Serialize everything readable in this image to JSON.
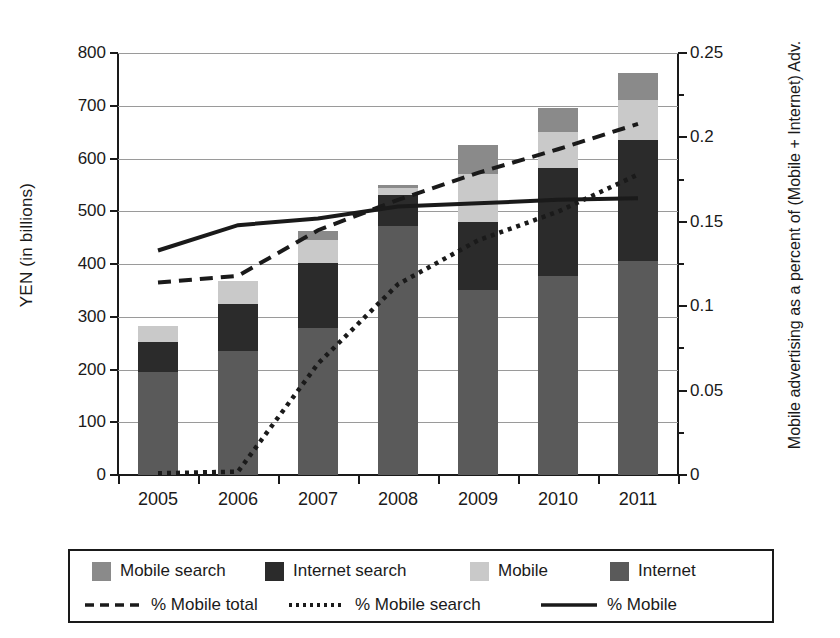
{
  "chart_data": {
    "type": "bar",
    "title": "",
    "xlabel": "",
    "ylabel": "YEN (in billions)",
    "ylabel_right": "Mobile advertising as a percent of (Mobile + Internet) Adv.",
    "categories": [
      "2005",
      "2006",
      "2007",
      "2008",
      "2009",
      "2010",
      "2011"
    ],
    "ylim": [
      0,
      800
    ],
    "yticks": [
      0,
      100,
      200,
      300,
      400,
      500,
      600,
      700,
      800
    ],
    "ytick_labels": [
      "0",
      "100",
      "200",
      "300",
      "400",
      "500",
      "600",
      "700",
      "800"
    ],
    "ylim_right": [
      0,
      0.25
    ],
    "yticks_right": [
      0,
      0.05,
      0.1,
      0.15,
      0.2,
      0.25
    ],
    "ytick_labels_right": [
      "0",
      "0.05",
      "0.1",
      "0.15",
      "0.2",
      "0.25"
    ],
    "yticks_right_minor": [
      0.025,
      0.075,
      0.125,
      0.175,
      0.225
    ],
    "grid": true,
    "legend_position": "below",
    "stacked": true,
    "series": [
      {
        "name": "Internet",
        "kind": "bar",
        "color": "#5a5a5a",
        "values": [
          195,
          235,
          278,
          472,
          350,
          378,
          405
        ]
      },
      {
        "name": "Internet search",
        "kind": "bar",
        "color": "#2b2b2b",
        "values": [
          57,
          90,
          124,
          58,
          130,
          204,
          230
        ]
      },
      {
        "name": "Mobile",
        "kind": "bar",
        "color": "#c9c9c9",
        "values": [
          31,
          43,
          43,
          15,
          90,
          68,
          75
        ]
      },
      {
        "name": "Mobile search",
        "kind": "bar",
        "color": "#8a8a8a",
        "values": [
          0,
          0,
          17,
          5,
          55,
          45,
          52
        ]
      },
      {
        "name": "% Mobile total",
        "kind": "line",
        "style": "dashed",
        "axis": "right",
        "color": "#1a1a1a",
        "values": [
          0.114,
          0.118,
          0.145,
          0.163,
          0.179,
          0.193,
          0.208
        ]
      },
      {
        "name": "% Mobile search",
        "kind": "line",
        "style": "dotted",
        "axis": "right",
        "color": "#1a1a1a",
        "values": [
          0.001,
          0.002,
          0.066,
          0.113,
          0.139,
          0.156,
          0.178
        ]
      },
      {
        "name": "% Mobile",
        "kind": "line",
        "style": "solid",
        "axis": "right",
        "color": "#1a1a1a",
        "values": [
          0.133,
          0.148,
          0.152,
          0.159,
          0.161,
          0.163,
          0.164
        ]
      }
    ]
  },
  "legend": {
    "swatch_items": [
      {
        "label": "Mobile search",
        "color": "#8a8a8a"
      },
      {
        "label": "Internet search",
        "color": "#2b2b2b"
      },
      {
        "label": "Mobile",
        "color": "#c9c9c9"
      },
      {
        "label": "Internet",
        "color": "#5a5a5a"
      }
    ],
    "line_items": [
      {
        "label": "% Mobile total",
        "style": "dashed"
      },
      {
        "label": "% Mobile search",
        "style": "dotted"
      },
      {
        "label": "% Mobile",
        "style": "solid"
      }
    ]
  }
}
